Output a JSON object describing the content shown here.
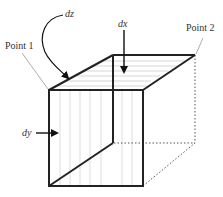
{
  "diagram": {
    "type": "cube-element",
    "labels": {
      "point1": "Point 1",
      "point2": "Point 2",
      "dz": "dz",
      "dx": "dx",
      "dy": "dy"
    },
    "colors": {
      "edge": "#222222",
      "hatch": "#bdbdbd",
      "dotted": "#555555",
      "label": "#333333"
    }
  }
}
